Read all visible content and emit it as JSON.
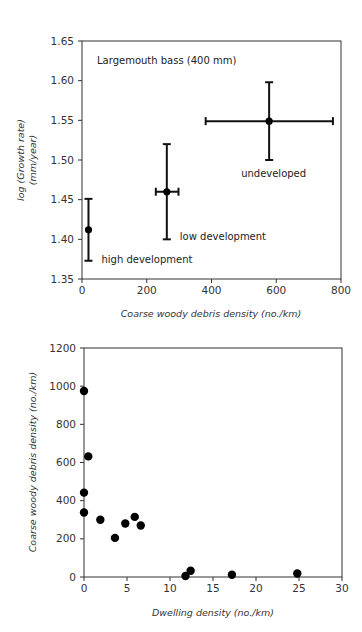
{
  "chart_data": [
    {
      "type": "scatter",
      "title": "",
      "annotation": "Largemouth bass (400 mm)",
      "xlabel": "Coarse woody debris density (no./km)",
      "ylabel_line1": "log (Growth rate)",
      "ylabel_line2": "(mm/year)",
      "xlim": [
        0,
        800
      ],
      "ylim": [
        1.35,
        1.65
      ],
      "xticks": [
        "0",
        "200",
        "400",
        "600",
        "800"
      ],
      "yticks": [
        "1.35",
        "1.40",
        "1.45",
        "1.50",
        "1.55",
        "1.60",
        "1.65"
      ],
      "grid": false,
      "legend": "none",
      "points": [
        {
          "label": "high development",
          "x": 20,
          "y": 1.412,
          "y_err_low": 1.373,
          "y_err_high": 1.451,
          "x_err_low": 20,
          "x_err_high": 20
        },
        {
          "label": "low development",
          "x": 262,
          "y": 1.46,
          "y_err_low": 1.4,
          "y_err_high": 1.52,
          "x_err_low": 228,
          "x_err_high": 298
        },
        {
          "label": "undeveloped",
          "x": 578,
          "y": 1.549,
          "y_err_low": 1.5,
          "y_err_high": 1.598,
          "x_err_low": 382,
          "x_err_high": 775
        }
      ]
    },
    {
      "type": "scatter",
      "title": "",
      "xlabel": "Dwelling density (no./km)",
      "ylabel": "Coarse woody debris density (no./km)",
      "xlim": [
        0,
        30
      ],
      "ylim": [
        0,
        1200
      ],
      "xticks": [
        "0",
        "5",
        "10",
        "15",
        "20",
        "25",
        "30"
      ],
      "yticks": [
        "0",
        "200",
        "400",
        "600",
        "800",
        "1000",
        "1200"
      ],
      "grid": false,
      "legend": "none",
      "series": [
        {
          "name": "lakes",
          "x": [
            0,
            0.5,
            0,
            0,
            1.9,
            3.6,
            4.8,
            5.9,
            6.6,
            11.8,
            12.4,
            17.2,
            24.8
          ],
          "y": [
            975,
            632,
            442,
            338,
            300,
            205,
            280,
            315,
            270,
            5,
            33,
            12,
            18
          ]
        }
      ]
    }
  ]
}
